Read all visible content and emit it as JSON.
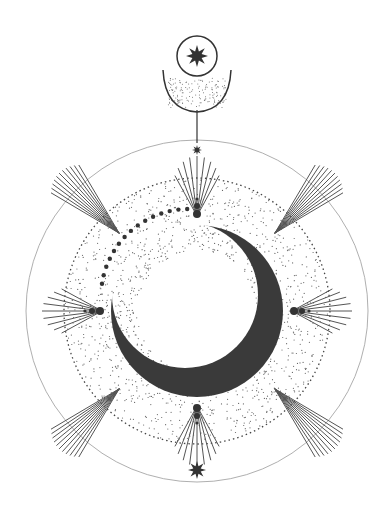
{
  "illustration": {
    "title": "Celestial crescent moon emblem",
    "colors": {
      "ink": "#3a3a3a",
      "background": "#ffffff",
      "stipple": "#6a6a6a"
    },
    "center": [
      197,
      311
    ],
    "outer_ring_radius": 171,
    "dotted_ring_radius": 133,
    "moon_radius": 86,
    "top_emblem": "star-in-circle-over-crescent-cup",
    "bottom_emblem": "eight-point-star"
  }
}
